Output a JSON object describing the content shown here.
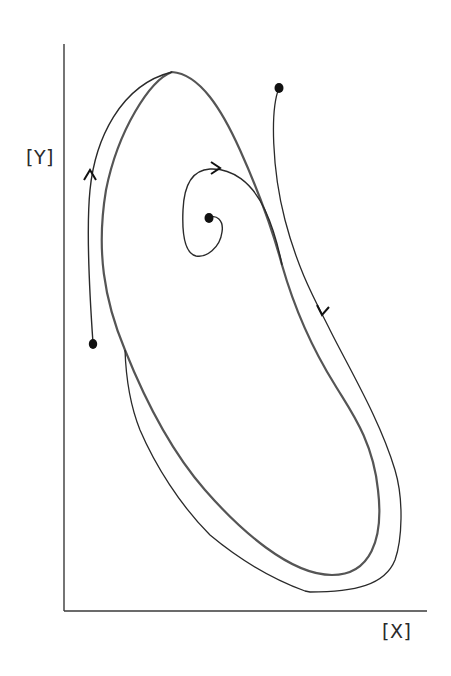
{
  "diagram": {
    "type": "phase-plane",
    "axes": {
      "x_label": "[X]",
      "y_label": "[Y]"
    },
    "elements": {
      "limit_cycle": {
        "label": "limit-cycle",
        "stroke": "#555555"
      },
      "trajectories": [
        {
          "name": "outer-left-trajectory",
          "start": "lower-left initial point",
          "direction": "up, joins limit cycle from outside"
        },
        {
          "name": "outer-right-trajectory",
          "start": "upper-right initial point",
          "direction": "down, joins limit cycle from outside"
        },
        {
          "name": "inner-spiral-trajectory",
          "start": "central unstable steady state",
          "direction": "spirals outward onto limit cycle"
        }
      ],
      "initial_points": 3,
      "arrows": 3
    },
    "colors": {
      "background": "#ffffff",
      "line": "#2a2a2a",
      "limit_cycle": "#555555",
      "dot": "#111111"
    }
  }
}
